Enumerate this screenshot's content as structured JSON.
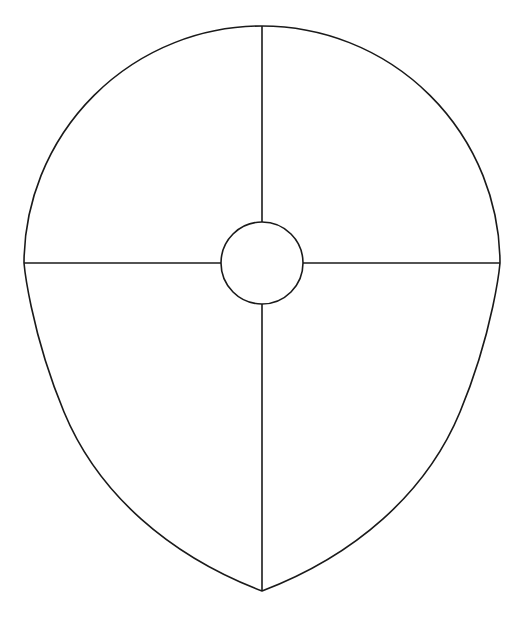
{
  "figure": {
    "title": "Shield outline with quartered divisions and central boss",
    "background_color": "#ffffff",
    "stroke_color": "#1a1a1a",
    "stroke_width": 1.6,
    "canvas": {
      "width": 523,
      "height": 617
    }
  },
  "chart_data": {
    "type": "diagram",
    "title": "Shield outline with quartered divisions and central boss",
    "xlabel": "",
    "ylabel": "",
    "grid": false,
    "legend": "none",
    "xlim": [
      0,
      523
    ],
    "ylim": [
      0,
      617
    ],
    "geometry": {
      "center": {
        "x": 262,
        "y": 263
      },
      "top_apex": {
        "x": 262,
        "y": 26
      },
      "bottom_apex": {
        "x": 262,
        "y": 591
      },
      "left_waist": {
        "x": 24,
        "y": 263
      },
      "right_waist": {
        "x": 500,
        "y": 263
      },
      "upper_arc_radius": 238,
      "boss_radius": 41,
      "boss_center": {
        "x": 262,
        "y": 263
      }
    },
    "elements": [
      {
        "name": "shield-outline",
        "kind": "closed-path",
        "description": "Semicircular upper half meeting curved lower flanks that taper to a point at the bottom"
      },
      {
        "name": "vertical-divider",
        "kind": "line",
        "from": {
          "x": 262,
          "y": 26
        },
        "to": {
          "x": 262,
          "y": 591
        },
        "description": "Vertical center line from top apex to bottom apex, interrupted by the central boss"
      },
      {
        "name": "horizontal-divider",
        "kind": "line",
        "from": {
          "x": 24,
          "y": 263
        },
        "to": {
          "x": 500,
          "y": 263
        },
        "description": "Horizontal line across the widest span, interrupted by the central boss"
      },
      {
        "name": "central-boss",
        "kind": "circle",
        "center": {
          "x": 262,
          "y": 263
        },
        "radius": 41,
        "description": "Small circle at the intersection of the two dividers"
      }
    ],
    "quadrants": [
      {
        "name": "upper-left",
        "label": ""
      },
      {
        "name": "upper-right",
        "label": ""
      },
      {
        "name": "lower-left",
        "label": ""
      },
      {
        "name": "lower-right",
        "label": ""
      }
    ],
    "paths": {
      "outline": "M 262 26 A 238 238 0 0 0 24 263 C 24 263 30 330 64 412 C 98 494 170 556 262 591 C 354 556 426 494 460 412 C 494 330 500 263 500 263 A 238 238 0 0 0 262 26 Z",
      "vertical_upper": "M 262 26 L 262 222",
      "vertical_lower": "M 262 304 L 262 591",
      "horizontal_left": "M 24 263 L 221 263",
      "horizontal_right": "M 303 263 L 500 263"
    }
  }
}
